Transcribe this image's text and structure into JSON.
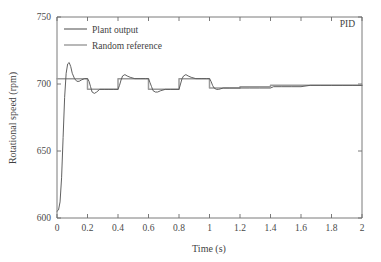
{
  "chart_data": {
    "type": "line",
    "title": "",
    "annotation": "PID",
    "xlabel": "Time (s)",
    "ylabel": "Rotational speed (rpm)",
    "xlim": [
      0,
      2
    ],
    "ylim": [
      600,
      750
    ],
    "xticks": [
      0,
      0.2,
      0.4,
      0.6,
      0.8,
      1,
      1.2,
      1.4,
      1.6,
      1.8,
      2
    ],
    "xticklabels": [
      "0",
      "0.2",
      "0.4",
      "0.6",
      "0.8",
      "1",
      "1.2",
      "1.4",
      "1.6",
      "1.8",
      "2"
    ],
    "yticks": [
      600,
      650,
      700,
      750
    ],
    "yticklabels": [
      "600",
      "650",
      "700",
      "750"
    ],
    "grid": false,
    "legend_position": "upper-left-inside",
    "legend": [
      {
        "name": "Plant output",
        "color": "#595959"
      },
      {
        "name": "Random reference",
        "color": "#9a9a9a"
      }
    ],
    "series": [
      {
        "name": "Random reference",
        "color": "#9a9a9a",
        "comment": "piecewise-constant random setpoint",
        "x": [
          0,
          0.2,
          0.2,
          0.4,
          0.4,
          0.6,
          0.6,
          0.8,
          0.8,
          1.0,
          1.0,
          1.2,
          1.2,
          1.4,
          1.4,
          1.6,
          1.6,
          1.8,
          1.8,
          2.0
        ],
        "y": [
          704,
          704,
          696,
          696,
          704,
          704,
          696,
          696,
          704,
          704,
          697,
          697,
          698,
          698,
          699,
          699,
          699,
          699,
          699,
          699
        ]
      },
      {
        "name": "Plant output",
        "color": "#595959",
        "comment": "closed-loop PID response; starts at 605, overshoots to 716 at t=0.08, then tracks steps with small overshoot/undershoot",
        "x": [
          0.0,
          0.01,
          0.02,
          0.03,
          0.04,
          0.05,
          0.06,
          0.07,
          0.08,
          0.09,
          0.1,
          0.115,
          0.13,
          0.145,
          0.16,
          0.18,
          0.2,
          0.21,
          0.22,
          0.23,
          0.245,
          0.26,
          0.28,
          0.31,
          0.34,
          0.37,
          0.4,
          0.41,
          0.42,
          0.43,
          0.445,
          0.46,
          0.48,
          0.51,
          0.545,
          0.58,
          0.6,
          0.61,
          0.62,
          0.63,
          0.645,
          0.66,
          0.68,
          0.71,
          0.745,
          0.78,
          0.8,
          0.81,
          0.82,
          0.83,
          0.845,
          0.86,
          0.88,
          0.91,
          0.945,
          0.98,
          1.0,
          1.01,
          1.02,
          1.03,
          1.045,
          1.06,
          1.09,
          1.13,
          1.18,
          1.2,
          1.26,
          1.33,
          1.4,
          1.42,
          1.47,
          1.54,
          1.6,
          1.66,
          1.73,
          1.8,
          1.87,
          1.94,
          2.0
        ],
        "y": [
          605,
          606,
          612,
          630,
          660,
          690,
          708,
          715,
          716,
          713,
          708,
          704,
          702,
          702,
          703,
          704,
          704,
          702,
          698,
          694,
          693,
          694,
          696,
          696,
          696,
          696,
          696,
          699,
          703,
          706,
          707,
          706,
          705,
          704,
          704,
          704,
          704,
          701,
          698,
          695,
          694,
          694,
          695,
          696,
          696,
          696,
          696,
          700,
          704,
          706,
          707,
          706,
          705,
          704,
          704,
          704,
          704,
          702,
          699,
          697,
          696,
          696,
          697,
          697,
          697,
          697,
          697,
          697,
          697,
          698,
          698,
          698,
          698,
          699,
          699,
          699,
          699,
          699,
          699
        ]
      }
    ]
  },
  "axes": {
    "x_title": "Time (s)",
    "y_title": "Rotational speed (rpm)"
  },
  "legend": {
    "item0": "Plant output",
    "item1": "Random reference"
  },
  "annotation": {
    "corner": "PID"
  },
  "colors": {
    "plant_output": "#595959",
    "random_reference": "#9a9a9a",
    "axis": "#6b6b6b",
    "background": "#ffffff"
  }
}
